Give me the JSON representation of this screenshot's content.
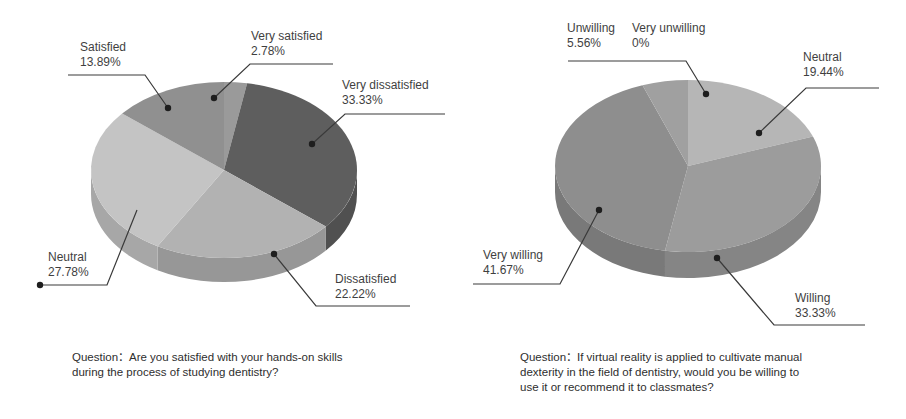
{
  "chart_data": [
    {
      "type": "pie",
      "style": "3d",
      "title": "Question：Are you satisfied with your hands-on skills during the process of studying dentistry?",
      "categories": [
        "Very satisfied",
        "Very dissatisfied",
        "Dissatisfied",
        "Neutral",
        "Satisfied"
      ],
      "values": [
        2.78,
        33.33,
        22.22,
        27.78,
        13.89
      ],
      "unit": "%",
      "colors": [
        "#9a9a9a",
        "#5e5e5e",
        "#b2b2b2",
        "#c4c4c4",
        "#909090"
      ],
      "legend": "none (callout labels)"
    },
    {
      "type": "pie",
      "style": "3d",
      "title": "Question：If virtual reality is applied to cultivate manual dexterity in the field of dentistry, would you be willing to use it or recommend it to classmates?",
      "categories": [
        "Very unwilling",
        "Neutral",
        "Willing",
        "Very willing",
        "Unwilling"
      ],
      "values": [
        0,
        19.44,
        33.33,
        41.67,
        5.56
      ],
      "unit": "%",
      "colors": [
        "#a0a0a0",
        "#b6b6b6",
        "#9c9c9c",
        "#8e8e8e",
        "#a0a0a0"
      ],
      "legend": "none (callout labels)"
    }
  ],
  "left": {
    "labels": {
      "satisfied": {
        "name": "Satisfied",
        "value": "13.89%"
      },
      "very_satisfied": {
        "name": "Very satisfied",
        "value": "2.78%"
      },
      "very_dissatisfied": {
        "name": "Very dissatisfied",
        "value": "33.33%"
      },
      "neutral": {
        "name": "Neutral",
        "value": "27.78%"
      },
      "dissatisfied": {
        "name": "Dissatisfied",
        "value": "22.22%"
      }
    },
    "question_line1": "Question：Are you satisfied with your hands-on skills",
    "question_line2": "during the process of studying dentistry?"
  },
  "right": {
    "labels": {
      "unwilling": {
        "name": "Unwilling",
        "value": "5.56%"
      },
      "very_unwilling": {
        "name": "Very unwilling",
        "value": "0%"
      },
      "neutral": {
        "name": "Neutral",
        "value": "19.44%"
      },
      "very_willing": {
        "name": "Very willing",
        "value": "41.67%"
      },
      "willing": {
        "name": "Willing",
        "value": "33.33%"
      }
    },
    "question_line1": "Question：If virtual reality is applied to cultivate manual",
    "question_line2": "dexterity in the field of dentistry, would you be willing to",
    "question_line3": "use it or recommend it to classmates?"
  }
}
